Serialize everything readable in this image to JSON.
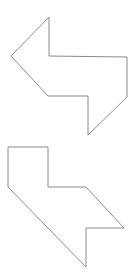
{
  "canvas": {
    "width": 133,
    "height": 280,
    "background": "#ffffff"
  },
  "style": {
    "stroke": "#8a8a8a"
  },
  "shapes": [
    {
      "id": "top-shape",
      "description": "Polygon resembling a left-pointing arrow joined to a down-pointing arrow",
      "points": "49,17 49,56 127,57 127,97 88,135 88,96 48,96 11,56"
    },
    {
      "id": "bottom-shape",
      "description": "Polygon resembling an L-shaped tab with a right-pointing notched arrow",
      "points": "8,147 48,147 48,187 86,187 124,228 86,228 86,267 8,187"
    }
  ]
}
